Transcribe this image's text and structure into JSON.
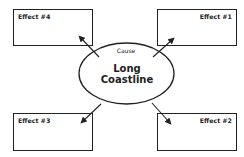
{
  "diagram": {
    "type": "cause-effect",
    "cause": {
      "label": "Cause",
      "title_line1": "Long",
      "title_line2": "Coastline"
    },
    "effects": [
      {
        "id": 1,
        "label": "Effect #1",
        "position": "top-right"
      },
      {
        "id": 2,
        "label": "Effect #2",
        "position": "bottom-right"
      },
      {
        "id": 3,
        "label": "Effect #3",
        "position": "bottom-left"
      },
      {
        "id": 4,
        "label": "Effect #4",
        "position": "top-left"
      }
    ]
  }
}
